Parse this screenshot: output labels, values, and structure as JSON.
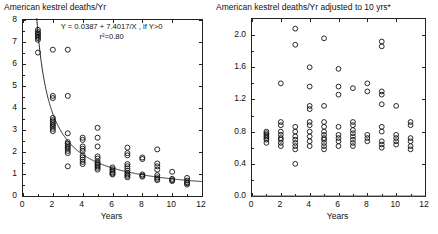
{
  "chart_data": [
    {
      "type": "scatter",
      "panel": "left",
      "title": "American kestrel deaths/Yr",
      "xlabel": "Years",
      "ylabel": "",
      "xlim": [
        0,
        12
      ],
      "ylim": [
        0,
        8
      ],
      "xticks": [
        0,
        2,
        4,
        6,
        8,
        10,
        12
      ],
      "xticklabels": [
        "0",
        "2",
        "4",
        "6",
        "8",
        "10",
        "12"
      ],
      "yticks": [
        0,
        1,
        2,
        3,
        4,
        5,
        6,
        7,
        8
      ],
      "yticklabels": [
        "0",
        "1",
        "2",
        "3",
        "4",
        "5",
        "6",
        "7",
        "8"
      ],
      "grid": false,
      "legend": null,
      "marker": "open-circle",
      "annotations": [
        {
          "text": "Y = 0.0387 + 7.4017/X , if Y>0",
          "line2": "r²=0.80"
        }
      ],
      "fit": {
        "form": "Y = a + b/X",
        "a": 0.0387,
        "b": 7.4017,
        "r2": 0.8,
        "condition": "if Y>0"
      },
      "points": [
        [
          1,
          7.55
        ],
        [
          1,
          7.45
        ],
        [
          1,
          7.38
        ],
        [
          1,
          7.32
        ],
        [
          1,
          7.25
        ],
        [
          1,
          7.18
        ],
        [
          1,
          7.1
        ],
        [
          1,
          6.52
        ],
        [
          2,
          6.65
        ],
        [
          2,
          4.55
        ],
        [
          2,
          4.45
        ],
        [
          2,
          3.55
        ],
        [
          2,
          3.45
        ],
        [
          2,
          3.38
        ],
        [
          2,
          3.3
        ],
        [
          2,
          3.22
        ],
        [
          2,
          3.15
        ],
        [
          2,
          3.05
        ],
        [
          2,
          2.95
        ],
        [
          3,
          6.65
        ],
        [
          3,
          4.55
        ],
        [
          3,
          2.85
        ],
        [
          3,
          2.45
        ],
        [
          3,
          2.38
        ],
        [
          3,
          2.3
        ],
        [
          3,
          2.22
        ],
        [
          3,
          2.15
        ],
        [
          3,
          2.05
        ],
        [
          3,
          1.95
        ],
        [
          3,
          1.35
        ],
        [
          4,
          2.65
        ],
        [
          4,
          2.55
        ],
        [
          4,
          2.25
        ],
        [
          4,
          2.15
        ],
        [
          4,
          2.05
        ],
        [
          4,
          1.85
        ],
        [
          4,
          1.75
        ],
        [
          4,
          1.65
        ],
        [
          4,
          1.55
        ],
        [
          4,
          1.45
        ],
        [
          5,
          3.1
        ],
        [
          5,
          2.65
        ],
        [
          5,
          2.25
        ],
        [
          5,
          1.8
        ],
        [
          5,
          1.7
        ],
        [
          5,
          1.55
        ],
        [
          5,
          1.48
        ],
        [
          5,
          1.42
        ],
        [
          5,
          1.35
        ],
        [
          5,
          1.28
        ],
        [
          5,
          1.2
        ],
        [
          6,
          1.3
        ],
        [
          6,
          1.22
        ],
        [
          6,
          1.15
        ],
        [
          6,
          1.08
        ],
        [
          6,
          1.02
        ],
        [
          6,
          0.98
        ],
        [
          7,
          2.2
        ],
        [
          7,
          1.95
        ],
        [
          7,
          1.85
        ],
        [
          7,
          1.45
        ],
        [
          7,
          1.35
        ],
        [
          7,
          1.25
        ],
        [
          7,
          1.15
        ],
        [
          7,
          1.05
        ],
        [
          7,
          0.98
        ],
        [
          7,
          0.92
        ],
        [
          7,
          0.85
        ],
        [
          8,
          1.75
        ],
        [
          8,
          1.68
        ],
        [
          8,
          0.98
        ],
        [
          8,
          0.92
        ],
        [
          8,
          0.88
        ],
        [
          9,
          2.12
        ],
        [
          9,
          1.48
        ],
        [
          9,
          1.35
        ],
        [
          9,
          1.2
        ],
        [
          9,
          0.95
        ],
        [
          9,
          0.85
        ],
        [
          9,
          0.78
        ],
        [
          9,
          0.72
        ],
        [
          10,
          1.1
        ],
        [
          10,
          0.78
        ],
        [
          10,
          0.72
        ],
        [
          10,
          0.68
        ],
        [
          11,
          0.82
        ],
        [
          11,
          0.7
        ],
        [
          11,
          0.62
        ],
        [
          11,
          0.58
        ],
        [
          11,
          0.52
        ]
      ]
    },
    {
      "type": "scatter",
      "panel": "right",
      "title": "American kestrel deaths/Yr adjusted to 10 yrs*",
      "xlabel": "Years",
      "ylabel": "",
      "xlim": [
        0,
        12
      ],
      "ylim": [
        0,
        2.2
      ],
      "xticks": [
        0,
        2,
        4,
        6,
        8,
        10,
        12
      ],
      "xticklabels": [
        "0",
        "2",
        "4",
        "6",
        "8",
        "10",
        "12"
      ],
      "yticks": [
        0.0,
        0.4,
        0.8,
        1.2,
        1.6,
        2.0
      ],
      "yticklabels": [
        "0.0",
        "0.4",
        "0.8",
        "1.2",
        "1.6",
        "2.0"
      ],
      "grid": false,
      "legend": null,
      "marker": "open-circle",
      "reference_line": {
        "y": 0.0
      },
      "points": [
        [
          1,
          0.8
        ],
        [
          1,
          0.78
        ],
        [
          1,
          0.76
        ],
        [
          1,
          0.74
        ],
        [
          1,
          0.72
        ],
        [
          1,
          0.7
        ],
        [
          1,
          0.66
        ],
        [
          2,
          1.4
        ],
        [
          2,
          0.92
        ],
        [
          2,
          0.88
        ],
        [
          2,
          0.8
        ],
        [
          2,
          0.76
        ],
        [
          2,
          0.72
        ],
        [
          2,
          0.7
        ],
        [
          2,
          0.66
        ],
        [
          2,
          0.62
        ],
        [
          3,
          2.08
        ],
        [
          3,
          1.88
        ],
        [
          3,
          0.86
        ],
        [
          3,
          0.8
        ],
        [
          3,
          0.74
        ],
        [
          3,
          0.7
        ],
        [
          3,
          0.66
        ],
        [
          3,
          0.62
        ],
        [
          3,
          0.58
        ],
        [
          3,
          0.4
        ],
        [
          4,
          1.6
        ],
        [
          4,
          1.36
        ],
        [
          4,
          1.12
        ],
        [
          4,
          1.08
        ],
        [
          4,
          0.92
        ],
        [
          4,
          0.88
        ],
        [
          4,
          0.8
        ],
        [
          4,
          0.74
        ],
        [
          4,
          0.68
        ],
        [
          4,
          0.62
        ],
        [
          5,
          1.96
        ],
        [
          5,
          1.12
        ],
        [
          5,
          0.92
        ],
        [
          5,
          0.86
        ],
        [
          5,
          0.8
        ],
        [
          5,
          0.76
        ],
        [
          5,
          0.72
        ],
        [
          5,
          0.7
        ],
        [
          5,
          0.66
        ],
        [
          5,
          0.62
        ],
        [
          5,
          0.58
        ],
        [
          6,
          1.58
        ],
        [
          6,
          1.36
        ],
        [
          6,
          1.26
        ],
        [
          6,
          0.86
        ],
        [
          6,
          0.76
        ],
        [
          6,
          0.72
        ],
        [
          6,
          0.68
        ],
        [
          6,
          0.62
        ],
        [
          7,
          1.34
        ],
        [
          7,
          0.92
        ],
        [
          7,
          0.88
        ],
        [
          7,
          0.82
        ],
        [
          7,
          0.78
        ],
        [
          7,
          0.74
        ],
        [
          7,
          0.7
        ],
        [
          7,
          0.66
        ],
        [
          7,
          0.62
        ],
        [
          8,
          1.4
        ],
        [
          8,
          1.3
        ],
        [
          8,
          0.76
        ],
        [
          8,
          0.72
        ],
        [
          8,
          0.68
        ],
        [
          9,
          1.92
        ],
        [
          9,
          1.86
        ],
        [
          9,
          1.3
        ],
        [
          9,
          1.26
        ],
        [
          9,
          1.14
        ],
        [
          9,
          0.86
        ],
        [
          9,
          0.8
        ],
        [
          9,
          0.68
        ],
        [
          9,
          0.64
        ],
        [
          9,
          0.6
        ],
        [
          10,
          1.12
        ],
        [
          10,
          0.76
        ],
        [
          10,
          0.72
        ],
        [
          10,
          0.68
        ],
        [
          10,
          0.64
        ],
        [
          11,
          0.92
        ],
        [
          11,
          0.88
        ],
        [
          11,
          0.72
        ],
        [
          11,
          0.68
        ],
        [
          11,
          0.62
        ],
        [
          11,
          0.58
        ]
      ]
    }
  ],
  "left_panel": {
    "title": "American kestrel deaths/Yr",
    "xaxis_title": "Years",
    "equation": "Y = 0.0387 + 7.4017/X , if Y>0",
    "r_squared": "r²=0.80"
  },
  "right_panel": {
    "title": "American kestrel deaths/Yr adjusted to 10 yrs*",
    "xaxis_title": "Years"
  }
}
